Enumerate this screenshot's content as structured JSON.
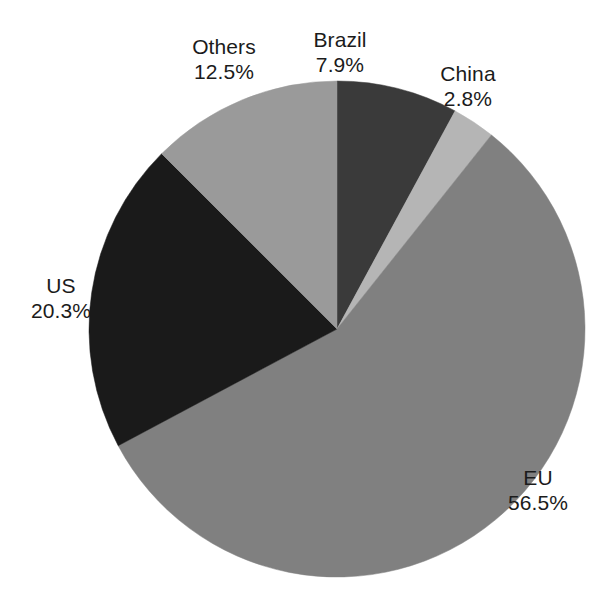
{
  "chart_data": {
    "type": "pie",
    "title": "",
    "subtitle": "",
    "xlabel": "",
    "ylabel": "",
    "grid": false,
    "legend": false,
    "legend_position": "none",
    "value_unit": "%",
    "categories": [
      "Brazil",
      "China",
      "EU",
      "US",
      "Others"
    ],
    "values": [
      7.9,
      2.8,
      56.5,
      20.3,
      12.5
    ],
    "start_angle_deg": 0,
    "direction": "clockwise",
    "slices": [
      {
        "name": "Brazil",
        "label": "Brazil",
        "value": 7.9,
        "value_label": "7.9%",
        "color": "#3a3a3a",
        "start_deg": 0,
        "end_deg": 28.44,
        "label_position": "top-center"
      },
      {
        "name": "China",
        "label": "China",
        "value": 2.8,
        "value_label": "2.8%",
        "color": "#b5b5b5",
        "start_deg": 28.44,
        "end_deg": 38.52,
        "label_position": "top-right"
      },
      {
        "name": "EU",
        "label": "EU",
        "value": 56.5,
        "value_label": "56.5%",
        "color": "#808080",
        "start_deg": 38.52,
        "end_deg": 241.92,
        "label_position": "bottom-right"
      },
      {
        "name": "US",
        "label": "US",
        "value": 20.3,
        "value_label": "20.3%",
        "color": "#1a1a1a",
        "start_deg": 241.92,
        "end_deg": 315.0,
        "label_position": "left"
      },
      {
        "name": "Others",
        "label": "Others",
        "value": 12.5,
        "value_label": "12.5%",
        "color": "#9a9a9a",
        "start_deg": 315.0,
        "end_deg": 360.0,
        "label_position": "top-left"
      }
    ],
    "geometry": {
      "center_x": 337,
      "center_y": 329,
      "radius": 248
    }
  }
}
